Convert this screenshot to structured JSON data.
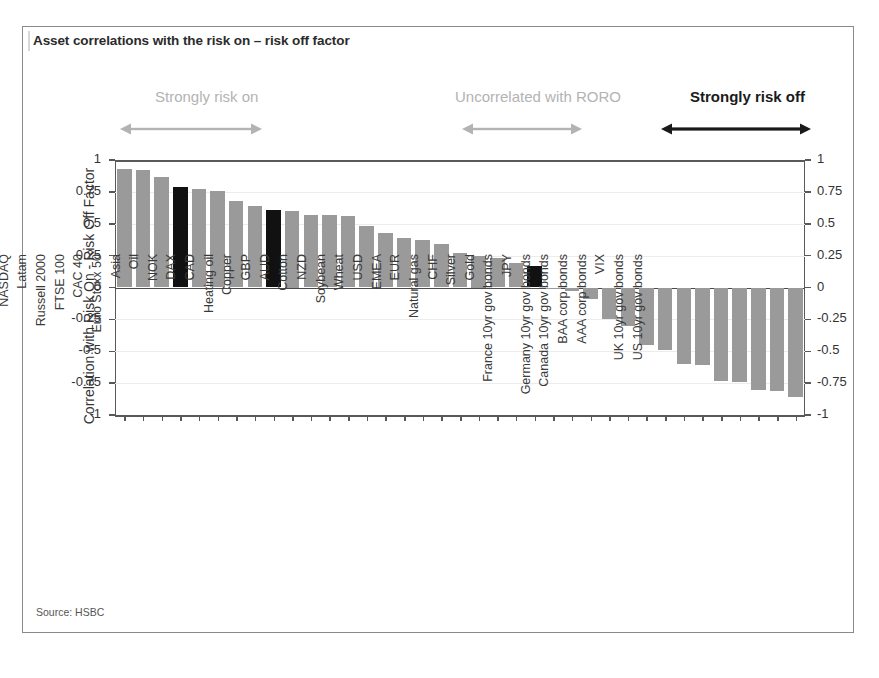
{
  "figure": {
    "title": "Asset correlations with the risk on – risk off factor",
    "source": "Source: HSBC",
    "colors": {
      "bar": "#9a9a9a",
      "highlight_bar": "#111111",
      "grey_annotation": "#b3b3b3",
      "black_annotation": "#1a1a1a",
      "axis": "#595959",
      "grid": "#ececec",
      "frame": "#8a8a8a"
    }
  },
  "annotations": [
    {
      "name": "strongly-risk-on",
      "text": "Strongly risk on",
      "style": "grey",
      "label_left": 155,
      "arrow_left": 120,
      "arrow_width": 142
    },
    {
      "name": "uncorrelated-with-roro",
      "text": "Uncorrelated with RORO",
      "style": "grey",
      "label_left": 455,
      "arrow_left": 462,
      "arrow_width": 120
    },
    {
      "name": "strongly-risk-off",
      "text": "Strongly risk off",
      "style": "black",
      "label_left": 690,
      "arrow_left": 661,
      "arrow_width": 150
    }
  ],
  "axis": {
    "y_label": "Correlation with Risk On - Risk Off Factor",
    "y_ticks": [
      "1",
      "0.75",
      "0.5",
      "0.25",
      "0",
      "-0.25",
      "-0.5",
      "-0.75",
      "-1"
    ],
    "y_tick_values": [
      1,
      0.75,
      0.5,
      0.25,
      0,
      -0.25,
      -0.5,
      -0.75,
      -1
    ],
    "y_min": -1,
    "y_max": 1
  },
  "chart_data": {
    "type": "bar",
    "title": "Asset correlations with the risk on – risk off factor",
    "xlabel": "",
    "ylabel": "Correlation with Risk On - Risk Off Factor",
    "ylim": [
      -1,
      1
    ],
    "grid": true,
    "legend": "none",
    "orientation": "vertical",
    "sorted": "descending",
    "highlight_color": "#111111",
    "bar_color": "#9a9a9a",
    "highlighted": [
      "Latam",
      "Asia",
      "EMEA"
    ],
    "categories": [
      "S&P",
      "Dow Jones",
      "NASDAQ",
      "Latam",
      "Russell 2000",
      "FTSE 100",
      "CAC 40",
      "Euro Stoxx 50",
      "Asia",
      "Oil",
      "NOK",
      "DAX",
      "CAD",
      "Heating oil",
      "Copper",
      "GBP",
      "AUD",
      "Cotton",
      "NZD",
      "Soybean",
      "Wheat",
      "USD",
      "EMEA",
      "EUR",
      "Natural gas",
      "CHF",
      "Silver",
      "Gold",
      "France 10yr gov bonds",
      "JPY",
      "Germany 10yr gov bonds",
      "Canada 10yr gov bonds",
      "BAA corp bonds",
      "AAA corp bonds",
      "VIX",
      "UK 10yr gov bonds",
      "US 10yr gov bonds"
    ],
    "values": [
      0.93,
      0.92,
      0.87,
      0.79,
      0.77,
      0.76,
      0.68,
      0.64,
      0.61,
      0.6,
      0.57,
      0.57,
      0.56,
      0.48,
      0.43,
      0.39,
      0.37,
      0.34,
      0.27,
      0.25,
      0.23,
      0.19,
      0.17,
      -0.01,
      -0.03,
      -0.09,
      -0.25,
      -0.3,
      -0.45,
      -0.49,
      -0.6,
      -0.61,
      -0.73,
      -0.74,
      -0.8,
      -0.81,
      -0.86
    ]
  }
}
